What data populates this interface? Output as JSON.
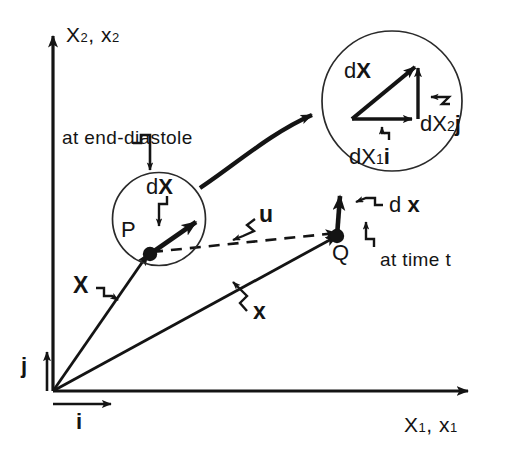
{
  "figure": {
    "background_color": "#ffffff",
    "ink_color": "#141414"
  },
  "axes": {
    "vertical": {
      "name": "vertical-axis",
      "label_main": "X",
      "label_main_sub": "2",
      "label_second": "x",
      "label_second_sub": "2",
      "separator": ", "
    },
    "horizontal": {
      "name": "horizontal-axis",
      "label_main": "X",
      "label_main_sub": "1",
      "label_second": "x",
      "label_second_sub": "1",
      "separator": ", "
    }
  },
  "basis_vectors": {
    "i": "i",
    "j": "j"
  },
  "points": {
    "p": "P",
    "q": "Q"
  },
  "vectors": {
    "position_reference": "X",
    "position_current": "x",
    "displacement": "u",
    "line_element_reference_d": "d",
    "line_element_reference": "X",
    "line_element_current_d": "d",
    "line_element_current": "x"
  },
  "annotations": {
    "end_diastole": "at end-diastole",
    "time_t": "at time t"
  },
  "magnifier": {
    "name": "magnified-inset",
    "vector_d": "d",
    "vector_main": "X",
    "component_x_d": "d",
    "component_x_main": "X",
    "component_x_sub": "1",
    "component_x_basis": "i",
    "component_y_d": "d",
    "component_y_main": "X",
    "component_y_sub": "2",
    "component_y_basis": "j"
  }
}
